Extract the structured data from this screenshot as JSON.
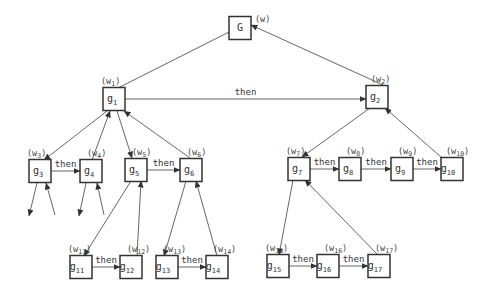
{
  "diagram": {
    "nodes": [
      {
        "id": "G",
        "base": "G",
        "sub": "",
        "weight_base": "(w",
        "weight_sub": "",
        "weight_close": ")"
      },
      {
        "id": "g1",
        "base": "g",
        "sub": "1",
        "weight_base": "(w",
        "weight_sub": "1",
        "weight_close": ")"
      },
      {
        "id": "g2",
        "base": "g",
        "sub": "2",
        "weight_base": "(w",
        "weight_sub": "2",
        "weight_close": ")"
      },
      {
        "id": "g3",
        "base": "g",
        "sub": "3",
        "weight_base": "(w",
        "weight_sub": "3",
        "weight_close": ")"
      },
      {
        "id": "g4",
        "base": "g",
        "sub": "4",
        "weight_base": "(w",
        "weight_sub": "4",
        "weight_close": ")"
      },
      {
        "id": "g5",
        "base": "g",
        "sub": "5",
        "weight_base": "(w",
        "weight_sub": "5",
        "weight_close": ")"
      },
      {
        "id": "g6",
        "base": "g",
        "sub": "6",
        "weight_base": "(w",
        "weight_sub": "6",
        "weight_close": ")"
      },
      {
        "id": "g7",
        "base": "g",
        "sub": "7",
        "weight_base": "(w",
        "weight_sub": "7",
        "weight_close": ")"
      },
      {
        "id": "g8",
        "base": "g",
        "sub": "8",
        "weight_base": "(w",
        "weight_sub": "8",
        "weight_close": ")"
      },
      {
        "id": "g9",
        "base": "g",
        "sub": "9",
        "weight_base": "(w",
        "weight_sub": "9",
        "weight_close": ")"
      },
      {
        "id": "g10",
        "base": "g",
        "sub": "10",
        "weight_base": "(w",
        "weight_sub": "10",
        "weight_close": ")"
      },
      {
        "id": "g11",
        "base": "g",
        "sub": "11",
        "weight_base": "(w",
        "weight_sub": "11",
        "weight_close": ")"
      },
      {
        "id": "g12",
        "base": "g",
        "sub": "12",
        "weight_base": "(w",
        "weight_sub": "12",
        "weight_close": ")"
      },
      {
        "id": "g13",
        "base": "g",
        "sub": "13",
        "weight_base": "(w",
        "weight_sub": "13",
        "weight_close": ")"
      },
      {
        "id": "g14",
        "base": "g",
        "sub": "14",
        "weight_base": "(w",
        "weight_sub": "14",
        "weight_close": ")"
      },
      {
        "id": "g15",
        "base": "g",
        "sub": "15",
        "weight_base": "(w",
        "weight_sub": "15",
        "weight_close": ")"
      },
      {
        "id": "g16",
        "base": "g",
        "sub": "16",
        "weight_base": "(w",
        "weight_sub": "16",
        "weight_close": ")"
      },
      {
        "id": "g17",
        "base": "g",
        "sub": "17",
        "weight_base": "(w",
        "weight_sub": "17",
        "weight_close": ")"
      }
    ],
    "then_label": "then",
    "then_edges": [
      {
        "from": "g1",
        "to": "g2"
      },
      {
        "from": "g3",
        "to": "g4"
      },
      {
        "from": "g5",
        "to": "g6"
      },
      {
        "from": "g7",
        "to": "g8"
      },
      {
        "from": "g8",
        "to": "g9"
      },
      {
        "from": "g9",
        "to": "g10"
      },
      {
        "from": "g11",
        "to": "g12"
      },
      {
        "from": "g13",
        "to": "g14"
      },
      {
        "from": "g15",
        "to": "g16"
      },
      {
        "from": "g16",
        "to": "g17"
      }
    ],
    "decomposition_edges": [
      {
        "parent": "G",
        "first": "g1",
        "last": "g2"
      },
      {
        "parent": "g1",
        "first": "g3",
        "last": "g6"
      },
      {
        "parent": "g1",
        "first": "g4",
        "last": "g5",
        "note": "inner pair"
      },
      {
        "parent": "g2",
        "first": "g7",
        "last": "g10"
      },
      {
        "parent": "g5",
        "first": "g11",
        "last": "g12"
      },
      {
        "parent": "g6",
        "first": "g13",
        "last": "g14"
      },
      {
        "parent": "g7",
        "first": "g15",
        "last": "g17"
      }
    ],
    "dangling_edges": [
      "g3",
      "g4"
    ],
    "colors": {
      "stroke": "#333333",
      "edge": "#555555",
      "background": "#ffffff"
    }
  }
}
